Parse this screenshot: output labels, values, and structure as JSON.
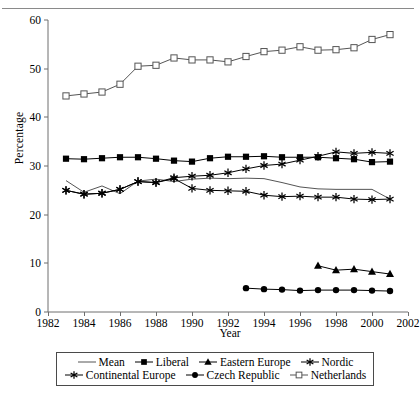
{
  "axes": {
    "ylabel": "Percentage",
    "xlabel": "Year",
    "yticks": [
      "0",
      "10",
      "20",
      "30",
      "40",
      "50",
      "60"
    ],
    "xticks": [
      "1982",
      "1984",
      "1986",
      "1988",
      "1990",
      "1992",
      "1994",
      "1996",
      "1998",
      "2000",
      "2002"
    ]
  },
  "legend": {
    "row1": [
      "Mean",
      "Liberal",
      "Eastern Europe",
      "Nordic"
    ],
    "row2": [
      "Continental Europe",
      "Czech Republic",
      "Netherlands"
    ]
  },
  "chart_data": {
    "type": "line",
    "title": "",
    "xlabel": "Year",
    "ylabel": "Percentage",
    "xlim": [
      1982,
      2002
    ],
    "ylim": [
      0,
      60
    ],
    "yticks": [
      0,
      10,
      20,
      30,
      40,
      50,
      60
    ],
    "xticks": [
      1982,
      1984,
      1986,
      1988,
      1990,
      1992,
      1994,
      1996,
      1998,
      2000,
      2002
    ],
    "grid": false,
    "legend_position": "bottom",
    "series": [
      {
        "name": "Mean",
        "marker": "none",
        "color": "#555555",
        "x": [
          1983,
          1984,
          1985,
          1986,
          1987,
          1988,
          1989,
          1990,
          1991,
          1992,
          1993,
          1994,
          1995,
          1996,
          1997,
          1998,
          1999,
          2000,
          2001
        ],
        "values": [
          27.0,
          24.6,
          25.9,
          24.3,
          26.9,
          27.3,
          26.8,
          27.3,
          27.5,
          27.4,
          27.5,
          27.4,
          26.6,
          25.7,
          25.3,
          25.2,
          25.2,
          25.2,
          23.2
        ]
      },
      {
        "name": "Liberal",
        "marker": "filled-square",
        "color": "#000000",
        "x": [
          1983,
          1984,
          1985,
          1986,
          1987,
          1988,
          1989,
          1990,
          1991,
          1992,
          1993,
          1994,
          1995,
          1996,
          1997,
          1998,
          1999,
          2000,
          2001
        ],
        "values": [
          31.5,
          31.4,
          31.6,
          31.8,
          31.8,
          31.5,
          31.1,
          30.9,
          31.6,
          31.9,
          31.9,
          32.0,
          31.8,
          31.8,
          31.8,
          31.6,
          31.4,
          30.8,
          30.9
        ]
      },
      {
        "name": "Eastern Europe",
        "marker": "filled-triangle",
        "color": "#000000",
        "x": [
          1997,
          1998,
          1999,
          2000,
          2001
        ],
        "values": [
          9.5,
          8.6,
          8.8,
          8.3,
          7.8
        ]
      },
      {
        "name": "Nordic",
        "marker": "star",
        "color": "#000000",
        "x": [
          1983,
          1984,
          1985,
          1986,
          1987,
          1988,
          1989,
          1990,
          1991,
          1992,
          1993,
          1994,
          1995,
          1996,
          1997,
          1998,
          1999,
          2000,
          2001
        ],
        "values": [
          25.0,
          24.2,
          24.4,
          25.2,
          26.8,
          26.6,
          27.6,
          27.9,
          28.1,
          28.6,
          29.4,
          30.1,
          30.4,
          31.2,
          32.0,
          32.9,
          32.6,
          32.8,
          32.6
        ]
      },
      {
        "name": "Continental Europe",
        "marker": "star",
        "color": "#000000",
        "x": [
          1983,
          1984,
          1985,
          1986,
          1987,
          1988,
          1989,
          1990,
          1991,
          1992,
          1993,
          1994,
          1995,
          1996,
          1997,
          1998,
          1999,
          2000,
          2001
        ],
        "values": [
          25.0,
          24.2,
          24.4,
          25.2,
          26.8,
          26.6,
          27.4,
          25.4,
          25.0,
          24.9,
          24.8,
          24.0,
          23.7,
          23.8,
          23.6,
          23.6,
          23.2,
          23.1,
          23.2
        ]
      },
      {
        "name": "Czech Republic",
        "marker": "filled-circle",
        "color": "#000000",
        "x": [
          1993,
          1994,
          1995,
          1996,
          1997,
          1998,
          1999,
          2000,
          2001
        ],
        "values": [
          4.9,
          4.7,
          4.6,
          4.4,
          4.5,
          4.5,
          4.5,
          4.4,
          4.3
        ]
      },
      {
        "name": "Netherlands",
        "marker": "open-square",
        "color": "#555555",
        "x": [
          1983,
          1984,
          1985,
          1986,
          1987,
          1988,
          1989,
          1990,
          1991,
          1992,
          1993,
          1994,
          1995,
          1996,
          1997,
          1998,
          1999,
          2000,
          2001
        ],
        "values": [
          44.4,
          44.8,
          45.2,
          46.8,
          50.5,
          50.7,
          52.2,
          51.8,
          51.8,
          51.4,
          52.5,
          53.5,
          53.8,
          54.5,
          53.8,
          53.9,
          54.3,
          56.0,
          57.0
        ]
      }
    ]
  }
}
